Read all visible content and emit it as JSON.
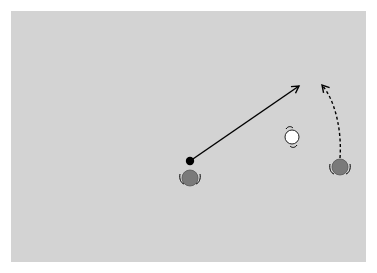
{
  "diagram": {
    "background_color": "#d3d3d3",
    "elements": [
      {
        "name": "ball",
        "type": "dot",
        "cx": 190,
        "cy": 161,
        "r": 4,
        "fill": "#000000"
      },
      {
        "name": "player-a",
        "type": "player",
        "cx": 190,
        "cy": 178,
        "r": 8,
        "fill": "#7a7a7a",
        "orientation": "facing-up"
      },
      {
        "name": "player-b",
        "type": "player",
        "cx": 292,
        "cy": 137,
        "r": 7,
        "fill": "#ffffff",
        "orientation": "rotated"
      },
      {
        "name": "player-c",
        "type": "player",
        "cx": 340,
        "cy": 167,
        "r": 8,
        "fill": "#7a7a7a",
        "orientation": "facing-up"
      },
      {
        "name": "pass-arrow",
        "type": "solid-arrow",
        "from": [
          190,
          161
        ],
        "to": [
          300,
          85
        ]
      },
      {
        "name": "run-arrow",
        "type": "dashed-arrow",
        "from": [
          340,
          158
        ],
        "to": [
          322,
          84
        ]
      }
    ]
  }
}
